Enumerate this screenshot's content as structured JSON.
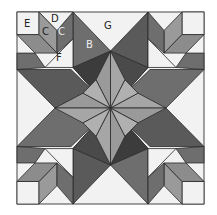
{
  "diagram": {
    "colors": {
      "background": "#f2f2f2",
      "frame": "#555555",
      "light": "#f2f2f2",
      "center": "#a6a6a6",
      "mid": "#8c8c8c",
      "dark": "#6e6e6e",
      "darker": "#555555",
      "darkest": "#3c3c3c",
      "pale": "#bdbdbd"
    },
    "labels": {
      "E": "E",
      "D": "D",
      "C1": "C",
      "C2": "C",
      "B": "B",
      "F": "F",
      "G": "G"
    }
  }
}
